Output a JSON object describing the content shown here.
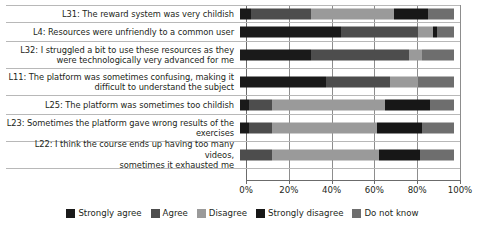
{
  "chart_data": {
    "type": "bar",
    "subtype": "stacked-horizontal-100-percent",
    "title": "",
    "xlabel": "",
    "ylabel": "",
    "xlim": [
      0,
      100
    ],
    "xticks": [
      "0%",
      "20%",
      "40%",
      "60%",
      "80%",
      "100%"
    ],
    "xtick_values": [
      0,
      20,
      40,
      60,
      80,
      100
    ],
    "grid": true,
    "legend_position": "bottom-center",
    "categories": [
      "L31: The reward system was very childish",
      "L4: Resources were unfriendly to a common user",
      "L32: I struggled a bit to use these resources as they were technologically very advanced for me",
      "L11: The platform was sometimes confusing, making it difficult to understand the subject",
      "L25: The platform was sometimes too childish",
      "L23: Sometimes the platform gave wrong results of the exercises",
      "L22: I think the course ends up having too many videos, sometimes it exhausted me"
    ],
    "series": [
      {
        "name": "Strongly agree",
        "color": "#1a1a1a",
        "values": [
          5,
          47,
          33,
          40,
          4,
          4,
          0
        ]
      },
      {
        "name": "Agree",
        "color": "#4d4d4d",
        "values": [
          28,
          36,
          46,
          30,
          11,
          11,
          15
        ]
      },
      {
        "name": "Disagree",
        "color": "#9a9a9a",
        "values": [
          39,
          7,
          6,
          13,
          53,
          49,
          50
        ]
      },
      {
        "name": "Strongly disagree",
        "color": "#171717",
        "values": [
          16,
          2,
          0,
          0,
          21,
          21,
          19
        ]
      },
      {
        "name": "Do not know",
        "color": "#6e6e6e",
        "values": [
          12,
          8,
          15,
          17,
          11,
          15,
          16
        ]
      }
    ]
  },
  "rows": [
    {
      "label_lines": [
        "L31: The reward system was very childish"
      ],
      "segments": [
        {
          "name": "Strongly agree",
          "value": 5,
          "color": "#1a1a1a"
        },
        {
          "name": "Agree",
          "value": 28,
          "color": "#4d4d4d"
        },
        {
          "name": "Disagree",
          "value": 39,
          "color": "#9a9a9a"
        },
        {
          "name": "Strongly disagree",
          "value": 16,
          "color": "#171717"
        },
        {
          "name": "Do not know",
          "value": 12,
          "color": "#6e6e6e"
        }
      ]
    },
    {
      "label_lines": [
        "L4: Resources were unfriendly to a common user"
      ],
      "segments": [
        {
          "name": "Strongly agree",
          "value": 47,
          "color": "#1a1a1a"
        },
        {
          "name": "Agree",
          "value": 36,
          "color": "#4d4d4d"
        },
        {
          "name": "Disagree",
          "value": 7,
          "color": "#9a9a9a"
        },
        {
          "name": "Strongly disagree",
          "value": 2,
          "color": "#171717"
        },
        {
          "name": "Do not know",
          "value": 8,
          "color": "#6e6e6e"
        }
      ]
    },
    {
      "label_lines": [
        "L32: I struggled a bit to use these resources as they",
        "were technologically very advanced for me"
      ],
      "segments": [
        {
          "name": "Strongly agree",
          "value": 33,
          "color": "#1a1a1a"
        },
        {
          "name": "Agree",
          "value": 46,
          "color": "#4d4d4d"
        },
        {
          "name": "Disagree",
          "value": 6,
          "color": "#9a9a9a"
        },
        {
          "name": "Strongly disagree",
          "value": 0,
          "color": "#171717"
        },
        {
          "name": "Do not know",
          "value": 15,
          "color": "#6e6e6e"
        }
      ]
    },
    {
      "label_lines": [
        "L11: The platform was sometimes confusing, making it",
        "difficult to understand the subject"
      ],
      "segments": [
        {
          "name": "Strongly agree",
          "value": 40,
          "color": "#1a1a1a"
        },
        {
          "name": "Agree",
          "value": 30,
          "color": "#4d4d4d"
        },
        {
          "name": "Disagree",
          "value": 13,
          "color": "#9a9a9a"
        },
        {
          "name": "Strongly disagree",
          "value": 0,
          "color": "#171717"
        },
        {
          "name": "Do not know",
          "value": 17,
          "color": "#6e6e6e"
        }
      ]
    },
    {
      "label_lines": [
        "L25: The platform was sometimes too childish"
      ],
      "segments": [
        {
          "name": "Strongly agree",
          "value": 4,
          "color": "#1a1a1a"
        },
        {
          "name": "Agree",
          "value": 11,
          "color": "#4d4d4d"
        },
        {
          "name": "Disagree",
          "value": 53,
          "color": "#9a9a9a"
        },
        {
          "name": "Strongly disagree",
          "value": 21,
          "color": "#171717"
        },
        {
          "name": "Do not know",
          "value": 11,
          "color": "#6e6e6e"
        }
      ]
    },
    {
      "label_lines": [
        "L23: Sometimes the platform gave wrong results of the",
        "exercises"
      ],
      "segments": [
        {
          "name": "Strongly agree",
          "value": 4,
          "color": "#1a1a1a"
        },
        {
          "name": "Agree",
          "value": 11,
          "color": "#4d4d4d"
        },
        {
          "name": "Disagree",
          "value": 49,
          "color": "#9a9a9a"
        },
        {
          "name": "Strongly disagree",
          "value": 21,
          "color": "#171717"
        },
        {
          "name": "Do not know",
          "value": 15,
          "color": "#6e6e6e"
        }
      ]
    },
    {
      "label_lines": [
        "L22: I think the course ends up having too many videos,",
        "sometimes it exhausted me"
      ],
      "segments": [
        {
          "name": "Strongly agree",
          "value": 0,
          "color": "#1a1a1a"
        },
        {
          "name": "Agree",
          "value": 15,
          "color": "#4d4d4d"
        },
        {
          "name": "Disagree",
          "value": 50,
          "color": "#9a9a9a"
        },
        {
          "name": "Strongly disagree",
          "value": 19,
          "color": "#171717"
        },
        {
          "name": "Do not know",
          "value": 16,
          "color": "#6e6e6e"
        }
      ]
    }
  ],
  "xaxis": {
    "ticks": [
      "0%",
      "20%",
      "40%",
      "60%",
      "80%",
      "100%"
    ]
  },
  "legend": {
    "items": [
      {
        "label": "Strongly agree",
        "color": "#1a1a1a"
      },
      {
        "label": "Agree",
        "color": "#4d4d4d"
      },
      {
        "label": "Disagree",
        "color": "#9a9a9a"
      },
      {
        "label": "Strongly disagree",
        "color": "#171717"
      },
      {
        "label": "Do not know",
        "color": "#6e6e6e"
      }
    ]
  }
}
